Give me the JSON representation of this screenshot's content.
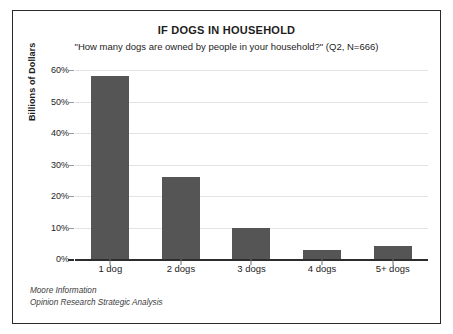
{
  "chart_data": {
    "type": "bar",
    "title": "IF DOGS IN HOUSEHOLD",
    "subtitle": "\"How many dogs are owned by people in your household?\" (Q2, N=666)",
    "categories": [
      "1 dog",
      "2 dogs",
      "3 dogs",
      "4 dogs",
      "5+ dogs"
    ],
    "values": [
      58,
      26,
      10,
      3,
      4
    ],
    "xlabel": "",
    "ylabel": "Billions of Dollars",
    "ylim": [
      0,
      60
    ],
    "ytick_values": [
      0,
      10,
      20,
      30,
      40,
      50,
      60
    ],
    "ytick_labels": [
      "0%",
      "10%",
      "20%",
      "30%",
      "40%",
      "50%",
      "60%"
    ],
    "grid": true,
    "legend": "none",
    "bar_color": "#555556",
    "gridline_color": "#e3e3e3",
    "axis_color": "#2d2d2d"
  },
  "source": {
    "line1": "Moore Information",
    "line2": "Opinion Research Strategic Analysis"
  }
}
